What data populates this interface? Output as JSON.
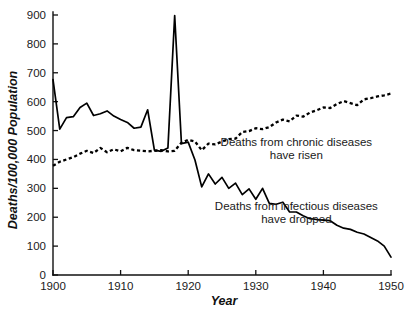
{
  "chart_data": {
    "type": "line",
    "title": "",
    "xlabel": "Year",
    "ylabel": "Deaths/100,000 Population",
    "xlim": [
      1900,
      1950
    ],
    "ylim": [
      0,
      900
    ],
    "xticks": [
      1900,
      1910,
      1920,
      1930,
      1940,
      1950
    ],
    "yticks": [
      0,
      100,
      200,
      300,
      400,
      500,
      600,
      700,
      800,
      900
    ],
    "grid": false,
    "legend_position": "inline-annotations",
    "annotations": [
      {
        "id": "chronic-annotation",
        "line1": "Deaths from chronic diseases",
        "line2": "have risen",
        "x": 1936,
        "y": 445
      },
      {
        "id": "infectious-annotation",
        "line1": "Deaths from infectious diseases",
        "line2": "have dropped",
        "x": 1936,
        "y": 225
      }
    ],
    "x": [
      1900,
      1901,
      1902,
      1903,
      1904,
      1905,
      1906,
      1907,
      1908,
      1909,
      1910,
      1911,
      1912,
      1913,
      1914,
      1915,
      1916,
      1917,
      1918,
      1919,
      1920,
      1921,
      1922,
      1923,
      1924,
      1925,
      1926,
      1927,
      1928,
      1929,
      1930,
      1931,
      1932,
      1933,
      1934,
      1935,
      1936,
      1937,
      1938,
      1939,
      1940,
      1941,
      1942,
      1943,
      1944,
      1945,
      1946,
      1947,
      1948,
      1949,
      1950
    ],
    "series": [
      {
        "name": "Deaths from infectious diseases",
        "style": "solid",
        "values": [
          676,
          505,
          545,
          548,
          580,
          595,
          552,
          558,
          568,
          550,
          538,
          528,
          508,
          512,
          572,
          432,
          428,
          440,
          898,
          455,
          460,
          398,
          305,
          350,
          315,
          338,
          300,
          318,
          278,
          298,
          262,
          300,
          248,
          245,
          252,
          218,
          218,
          205,
          195,
          192,
          190,
          188,
          172,
          162,
          158,
          148,
          142,
          130,
          118,
          100,
          62
        ]
      },
      {
        "name": "Deaths from chronic diseases",
        "style": "dashed",
        "values": [
          378,
          392,
          400,
          408,
          420,
          430,
          422,
          440,
          425,
          435,
          428,
          440,
          432,
          430,
          428,
          430,
          432,
          428,
          430,
          458,
          468,
          462,
          432,
          455,
          452,
          462,
          470,
          472,
          495,
          498,
          508,
          505,
          512,
          528,
          538,
          532,
          552,
          548,
          562,
          570,
          580,
          578,
          592,
          602,
          595,
          588,
          608,
          612,
          618,
          622,
          628
        ]
      }
    ]
  }
}
